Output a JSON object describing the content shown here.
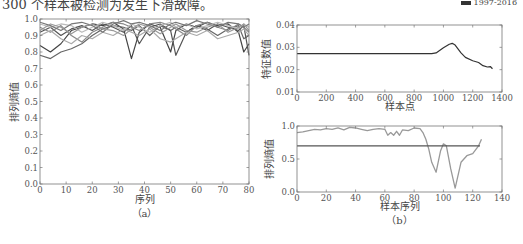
{
  "page": {
    "top_caption": "300 个样本被检测为发生下滑故障。",
    "corner_mark": "1997-2016"
  },
  "chart_data": [
    {
      "id": "a",
      "type": "line",
      "panel_label": "（a）",
      "title": "",
      "xlabel": "序列",
      "ylabel": "排列熵值",
      "xlim": [
        0,
        80
      ],
      "ylim": [
        0,
        1.0
      ],
      "xticks": [
        0,
        10,
        20,
        30,
        40,
        50,
        60,
        70,
        80
      ],
      "yticks": [
        0.0,
        0.1,
        0.2,
        0.3,
        0.4,
        0.5,
        0.6,
        0.7,
        0.8,
        0.9,
        1.0
      ],
      "grid": false,
      "legend": null,
      "note": "Many overlapping grayscale series of permutation entropy, mostly between 0.75 and 1.0",
      "x": [
        0,
        4,
        8,
        12,
        16,
        20,
        24,
        28,
        32,
        35,
        38,
        42,
        46,
        50,
        52,
        56,
        60,
        64,
        68,
        72,
        76,
        78,
        80
      ],
      "series": [
        {
          "name": "s1",
          "color": "#444444",
          "values": [
            0.84,
            0.8,
            0.85,
            0.93,
            0.95,
            0.97,
            0.96,
            0.98,
            0.94,
            0.76,
            0.92,
            0.97,
            0.95,
            0.8,
            0.93,
            0.97,
            0.95,
            0.98,
            0.96,
            0.97,
            0.92,
            0.8,
            0.85
          ]
        },
        {
          "name": "s2",
          "color": "#666666",
          "values": [
            0.78,
            0.76,
            0.8,
            0.82,
            0.85,
            0.9,
            0.94,
            0.96,
            0.95,
            0.93,
            0.96,
            0.9,
            0.96,
            0.93,
            0.95,
            0.92,
            0.96,
            0.94,
            0.9,
            0.94,
            0.96,
            0.88,
            0.9
          ]
        },
        {
          "name": "s3",
          "color": "#555555",
          "values": [
            0.92,
            0.95,
            0.9,
            0.94,
            0.96,
            0.93,
            0.97,
            0.95,
            0.92,
            0.96,
            0.85,
            0.95,
            0.97,
            0.93,
            0.78,
            0.92,
            0.96,
            0.93,
            0.97,
            0.95,
            0.93,
            0.96,
            0.78
          ]
        },
        {
          "name": "s4",
          "color": "#888888",
          "values": [
            0.95,
            0.92,
            0.96,
            0.9,
            0.86,
            0.92,
            0.95,
            0.98,
            0.97,
            0.95,
            0.93,
            0.97,
            0.98,
            0.96,
            0.94,
            0.9,
            0.96,
            0.98,
            0.95,
            0.93,
            0.97,
            0.95,
            0.92
          ]
        },
        {
          "name": "s5",
          "color": "#aaaaaa",
          "values": [
            0.9,
            0.93,
            0.88,
            0.85,
            0.9,
            0.88,
            0.92,
            0.9,
            0.94,
            0.92,
            0.9,
            0.94,
            0.88,
            0.86,
            0.88,
            0.92,
            0.9,
            0.93,
            0.88,
            0.9,
            0.92,
            0.94,
            0.9
          ]
        },
        {
          "name": "s6",
          "color": "#bbbbbb",
          "values": [
            0.97,
            0.95,
            0.97,
            0.96,
            0.92,
            0.95,
            0.98,
            0.96,
            0.93,
            0.97,
            0.95,
            0.92,
            0.96,
            0.98,
            0.95,
            0.97,
            0.94,
            0.96,
            0.98,
            0.96,
            0.94,
            0.97,
            0.95
          ]
        },
        {
          "name": "s7",
          "color": "#777777",
          "values": [
            0.98,
            0.96,
            0.93,
            0.97,
            0.98,
            0.96,
            0.92,
            0.97,
            0.99,
            0.97,
            0.98,
            0.96,
            0.93,
            0.97,
            0.98,
            0.96,
            0.99,
            0.97,
            0.95,
            0.98,
            0.97,
            0.95,
            0.97
          ]
        },
        {
          "name": "s8",
          "color": "#999999",
          "values": [
            0.93,
            0.97,
            0.95,
            0.91,
            0.95,
            0.97,
            0.94,
            0.93,
            0.9,
            0.94,
            0.97,
            0.95,
            0.91,
            0.95,
            0.97,
            0.93,
            0.92,
            0.95,
            0.97,
            0.92,
            0.95,
            0.97,
            0.93
          ]
        }
      ]
    },
    {
      "id": "b_top",
      "type": "line",
      "panel_label": "",
      "title": "",
      "xlabel": "样本点",
      "ylabel": "特征数值",
      "xlim": [
        0,
        1400
      ],
      "ylim": [
        0.01,
        0.04
      ],
      "xticks": [
        0,
        200,
        400,
        600,
        800,
        1000,
        1200,
        1400
      ],
      "yticks": [
        0.01,
        0.02,
        0.03,
        0.04
      ],
      "grid": false,
      "legend": null,
      "x": [
        0,
        200,
        400,
        600,
        800,
        920,
        950,
        1000,
        1040,
        1060,
        1080,
        1120,
        1150,
        1200,
        1240,
        1270,
        1300,
        1320,
        1335
      ],
      "series": [
        {
          "name": "feature",
          "color": "#333333",
          "values": [
            0.0272,
            0.0272,
            0.0272,
            0.0272,
            0.0272,
            0.0272,
            0.0275,
            0.0298,
            0.0314,
            0.0318,
            0.031,
            0.0275,
            0.0255,
            0.024,
            0.0232,
            0.0218,
            0.0212,
            0.0214,
            0.0204
          ]
        }
      ]
    },
    {
      "id": "b_bottom",
      "type": "line",
      "panel_label": "（b）",
      "title": "",
      "xlabel": "样本序列",
      "ylabel": "排列熵值",
      "xlim": [
        0,
        140
      ],
      "ylim": [
        0.0,
        1.0
      ],
      "xticks": [
        0,
        20,
        40,
        60,
        80,
        100,
        120,
        140
      ],
      "yticks": [
        0.0,
        0.5,
        1.0
      ],
      "grid": false,
      "legend": null,
      "x": [
        0,
        4,
        8,
        12,
        16,
        20,
        24,
        28,
        32,
        36,
        40,
        44,
        48,
        52,
        56,
        60,
        62,
        64,
        66,
        68,
        70,
        72,
        76,
        80,
        84,
        86,
        88,
        90,
        92,
        95,
        98,
        100,
        102,
        105,
        108,
        112,
        116,
        120,
        124,
        126
      ],
      "series": [
        {
          "name": "entropy",
          "color": "#999999",
          "values": [
            0.9,
            0.91,
            0.93,
            0.95,
            0.94,
            0.96,
            0.95,
            0.97,
            0.94,
            0.98,
            0.97,
            0.95,
            0.93,
            0.95,
            0.96,
            0.95,
            0.86,
            0.9,
            0.86,
            0.92,
            0.86,
            0.94,
            0.93,
            0.97,
            0.96,
            0.9,
            0.8,
            0.65,
            0.45,
            0.3,
            0.62,
            0.73,
            0.7,
            0.35,
            0.06,
            0.45,
            0.55,
            0.58,
            0.7,
            0.8
          ]
        },
        {
          "name": "threshold",
          "color": "#555555",
          "values_const": 0.7,
          "x_range": [
            0,
            125
          ]
        }
      ]
    }
  ]
}
